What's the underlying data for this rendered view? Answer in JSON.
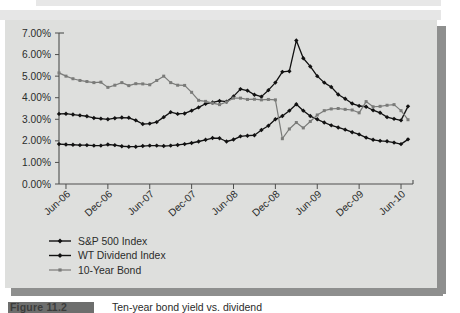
{
  "figure": {
    "caption_tag": "Figure 11.2",
    "caption_text": "Ten-year bond yield vs. dividend"
  },
  "chart_data": {
    "type": "line",
    "title": "",
    "subtitle": "",
    "xlabel": "",
    "ylabel": "",
    "grid": false,
    "legend_position": "bottom-left",
    "ylim": [
      0,
      0.07
    ],
    "ytick_labels": [
      "0.00%",
      "1.00%",
      "2.00%",
      "3.00%",
      "4.00%",
      "5.00%",
      "6.00%",
      "7.00%"
    ],
    "ytick_values": [
      0.0,
      0.01,
      0.02,
      0.03,
      0.04,
      0.05,
      0.06,
      0.07
    ],
    "xtick_labels": [
      "Jun-06",
      "Dec-06",
      "Jun-07",
      "Dec-07",
      "Jun-08",
      "Dec-08",
      "Jun-09",
      "Dec-09",
      "Jun-10"
    ],
    "xtick_indices": [
      1,
      7,
      13,
      19,
      25,
      31,
      37,
      43,
      49
    ],
    "x": [
      "Apr-06",
      "Jun-06",
      "Jul-06",
      "Aug-06",
      "Sep-06",
      "Oct-06",
      "Nov-06",
      "Dec-06",
      "Jan-07",
      "Feb-07",
      "Mar-07",
      "Apr-07",
      "May-07",
      "Jun-07",
      "Jul-07",
      "Aug-07",
      "Sep-07",
      "Oct-07",
      "Nov-07",
      "Dec-07",
      "Jan-08",
      "Feb-08",
      "Mar-08",
      "Apr-08",
      "May-08",
      "Jun-08",
      "Jul-08",
      "Aug-08",
      "Sep-08",
      "Oct-08",
      "Nov-08",
      "Dec-08",
      "Jan-09",
      "Feb-09",
      "Mar-09",
      "Apr-09",
      "May-09",
      "Jun-09",
      "Jul-09",
      "Aug-09",
      "Sep-09",
      "Oct-09",
      "Nov-09",
      "Dec-09",
      "Jan-10",
      "Feb-10",
      "Mar-10",
      "Apr-10",
      "May-10",
      "Jun-10",
      "Jul-10"
    ],
    "series": [
      {
        "name": "S&P 500 Index",
        "color": "#111111",
        "marker": "diamond",
        "values": [
          0.0185,
          0.0183,
          0.0182,
          0.018,
          0.018,
          0.0178,
          0.0178,
          0.0183,
          0.018,
          0.0175,
          0.0173,
          0.0173,
          0.0176,
          0.0178,
          0.0178,
          0.0176,
          0.0178,
          0.0181,
          0.0185,
          0.019,
          0.0197,
          0.0205,
          0.0213,
          0.0212,
          0.0197,
          0.0206,
          0.0221,
          0.0224,
          0.0226,
          0.025,
          0.027,
          0.03,
          0.0315,
          0.034,
          0.037,
          0.034,
          0.0315,
          0.03,
          0.0285,
          0.0272,
          0.0262,
          0.0252,
          0.024,
          0.023,
          0.0215,
          0.0205,
          0.02,
          0.0198,
          0.0192,
          0.0185,
          0.0207
        ]
      },
      {
        "name": "WT Dividend Index",
        "color": "#111111",
        "marker": "diamond",
        "values": [
          0.0325,
          0.0326,
          0.0322,
          0.0318,
          0.0314,
          0.0306,
          0.0303,
          0.03,
          0.0305,
          0.0308,
          0.0307,
          0.0295,
          0.0278,
          0.028,
          0.0287,
          0.031,
          0.0333,
          0.0325,
          0.0327,
          0.034,
          0.0355,
          0.0372,
          0.0378,
          0.0385,
          0.0382,
          0.0406,
          0.044,
          0.0433,
          0.0414,
          0.0405,
          0.0435,
          0.047,
          0.052,
          0.0523,
          0.0665,
          0.0583,
          0.0545,
          0.05,
          0.047,
          0.045,
          0.0415,
          0.0395,
          0.0373,
          0.0362,
          0.0358,
          0.0342,
          0.033,
          0.031,
          0.0302,
          0.0295,
          0.036
        ]
      },
      {
        "name": "10-Year Bond",
        "color": "#7a7b79",
        "marker": "square",
        "values": [
          0.0515,
          0.05,
          0.0488,
          0.048,
          0.0475,
          0.047,
          0.0472,
          0.0448,
          0.0458,
          0.047,
          0.0456,
          0.0465,
          0.0464,
          0.046,
          0.048,
          0.05,
          0.047,
          0.0458,
          0.0457,
          0.0425,
          0.0388,
          0.0383,
          0.0375,
          0.0368,
          0.038,
          0.0398,
          0.0398,
          0.0392,
          0.0393,
          0.039,
          0.0392,
          0.039,
          0.021,
          0.0255,
          0.0285,
          0.026,
          0.029,
          0.032,
          0.034,
          0.0348,
          0.035,
          0.0346,
          0.0343,
          0.033,
          0.0382,
          0.0358,
          0.036,
          0.0365,
          0.0368,
          0.034,
          0.0298
        ]
      }
    ],
    "legend": [
      {
        "label": "S&P 500 Index",
        "color": "#111111"
      },
      {
        "label": "WT Dividend Index",
        "color": "#111111"
      },
      {
        "label": "10-Year Bond",
        "color": "#7a7b79"
      }
    ]
  }
}
